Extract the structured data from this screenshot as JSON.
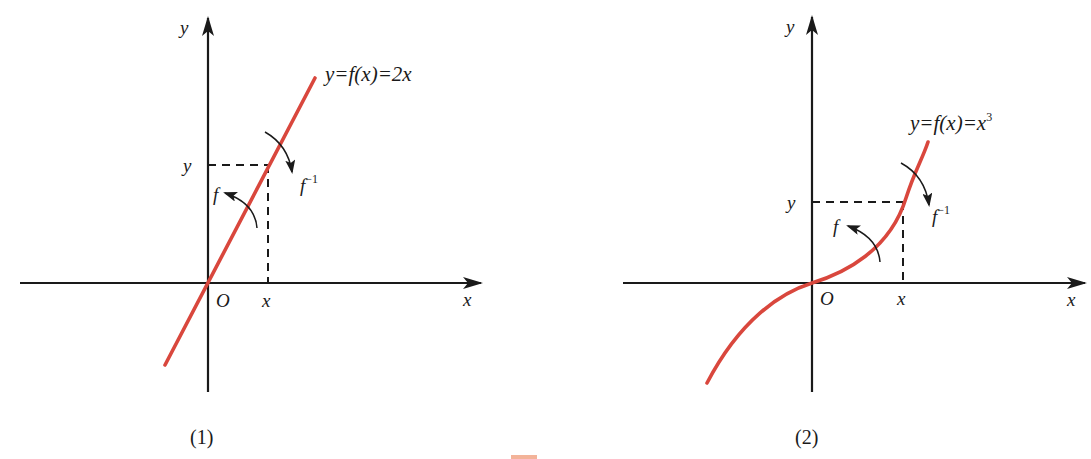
{
  "figure": {
    "panels": [
      {
        "id": "1",
        "caption": "(1)",
        "equation": "y=f(x)=2x",
        "function": "2x",
        "axis_labels": {
          "x": "x",
          "y": "y"
        },
        "origin_label": "O",
        "point_labels": {
          "x": "x",
          "y": "y"
        },
        "arrow_labels": {
          "forward": "f",
          "inverse": "f",
          "inverse_sup": "−1"
        },
        "curve_color": "#d9473d"
      },
      {
        "id": "2",
        "caption": "(2)",
        "equation": "y=f(x)=x",
        "equation_sup": "3",
        "function": "x^3",
        "axis_labels": {
          "x": "x",
          "y": "y"
        },
        "origin_label": "O",
        "point_labels": {
          "x": "x",
          "y": "y"
        },
        "arrow_labels": {
          "forward": "f",
          "inverse": "f",
          "inverse_sup": "−1"
        },
        "curve_color": "#d9473d"
      }
    ]
  }
}
